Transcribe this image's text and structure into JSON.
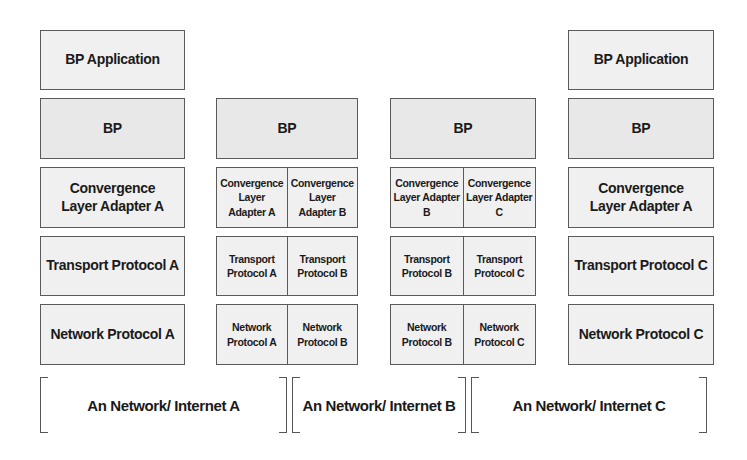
{
  "diagram": {
    "stacks": [
      {
        "id": "node-1",
        "layers": [
          {
            "name": "application",
            "label": "BP Application"
          },
          {
            "name": "bp",
            "label": "BP"
          },
          {
            "name": "cla",
            "label": "Convergence Layer Adapter A"
          },
          {
            "name": "transport",
            "label": "Transport Protocol A"
          },
          {
            "name": "network",
            "label": "Network Protocol A"
          }
        ]
      },
      {
        "id": "node-2",
        "layers": [
          {
            "name": "bp",
            "label": "BP"
          },
          {
            "name": "cla",
            "cells": [
              "Convergence Layer Adapter A",
              "Convergence Layer Adapter B"
            ]
          },
          {
            "name": "transport",
            "cells": [
              "Transport Protocol A",
              "Transport Protocol B"
            ]
          },
          {
            "name": "network",
            "cells": [
              "Network Protocol A",
              "Network Protocol B"
            ]
          }
        ]
      },
      {
        "id": "node-3",
        "layers": [
          {
            "name": "bp",
            "label": "BP"
          },
          {
            "name": "cla",
            "cells": [
              "Convergence Layer Adapter B",
              "Convergence Layer Adapter C"
            ]
          },
          {
            "name": "transport",
            "cells": [
              "Transport Protocol B",
              "Transport Protocol C"
            ]
          },
          {
            "name": "network",
            "cells": [
              "Network Protocol B",
              "Network Protocol C"
            ]
          }
        ]
      },
      {
        "id": "node-4",
        "layers": [
          {
            "name": "application",
            "label": "BP Application"
          },
          {
            "name": "bp",
            "label": "BP"
          },
          {
            "name": "cla",
            "label": "Convergence Layer Adapter A"
          },
          {
            "name": "transport",
            "label": "Transport Protocol C"
          },
          {
            "name": "network",
            "label": "Network Protocol C"
          }
        ]
      }
    ],
    "networks": [
      {
        "label": "An Network/ Internet A"
      },
      {
        "label": "An Network/ Internet B"
      },
      {
        "label": "An Network/ Internet C"
      }
    ],
    "colors": {
      "box_fill": "#f0f0f0",
      "border": "#5a5a5a",
      "text": "#1a1a1a"
    }
  }
}
